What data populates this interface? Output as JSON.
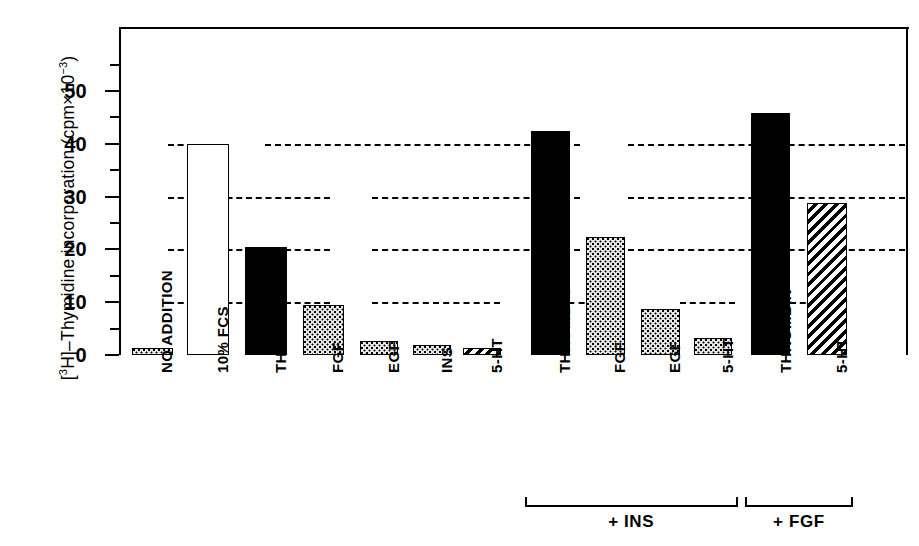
{
  "chart_data": {
    "type": "bar",
    "title": "",
    "xlabel": "",
    "ylabel": "[³H]–Thymidine incorporation (cpm×10⁻³)",
    "ylabel_parts": {
      "prefix": "[",
      "iso_sup": "3",
      "iso": "H]–Thymidine incorporation (cpm×10",
      "exp_sup": "−3",
      "suffix": ")"
    },
    "ylim": [
      0,
      57
    ],
    "ytick_values": [
      0,
      10,
      20,
      30,
      40,
      50
    ],
    "ytick_labels": [
      "0",
      "10",
      "20",
      "30",
      "40",
      "50"
    ],
    "yminor_values": [
      5,
      15,
      25,
      35,
      45,
      55
    ],
    "grid": true,
    "gridlines": [
      10,
      20,
      30,
      40
    ],
    "legend": "none",
    "categories": [
      "NO ADDITION",
      "10% FCS",
      "THROMBIN",
      "FGF",
      "EGF",
      "INS",
      "5-HT",
      "THROMBIN",
      "FGF",
      "EGF",
      "5-HT",
      "THROMBIN",
      "5-HT"
    ],
    "values": [
      0.8,
      40.0,
      20.4,
      9.5,
      2.7,
      1.9,
      1.1,
      42.4,
      22.4,
      8.8,
      3.2,
      45.8,
      28.8
    ],
    "patterns": [
      "dots",
      "open",
      "solid",
      "dots",
      "dots",
      "dots",
      "diag",
      "solid",
      "dots",
      "dots",
      "dots",
      "solid",
      "diag"
    ],
    "groups": [
      {
        "label": "",
        "from": 0,
        "to": 6
      },
      {
        "label": "+ INS",
        "from": 7,
        "to": 10
      },
      {
        "label": "+ FGF",
        "from": 11,
        "to": 12
      }
    ],
    "group_brackets": [
      {
        "label": "+ INS",
        "start_index": 7,
        "end_index": 10
      },
      {
        "label": "+ FGF",
        "start_index": 11,
        "end_index": 12
      }
    ],
    "colors": {
      "axis": "#000000",
      "bar_outline": "#000000",
      "bar_solid": "#000000",
      "bar_open": "#ffffff",
      "bar_dots": "#e8e8e8",
      "background": "#ffffff"
    }
  }
}
